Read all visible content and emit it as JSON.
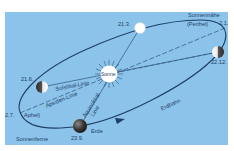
{
  "diagram": {
    "colors": {
      "background": "#8cc3ea",
      "orbit_line": "#1e3f66",
      "sun": "#ffffff",
      "text": "#1e3f66"
    },
    "sun": {
      "label": "Sonne"
    },
    "positions": [
      {
        "date": "21.3.",
        "phase": "white"
      },
      {
        "date": "22.12.",
        "phase": "dark-left"
      },
      {
        "date": "21.6.",
        "phase": "dark-left"
      },
      {
        "date": "23.9.",
        "phase": "dark",
        "name": "Erde"
      }
    ],
    "perihel": {
      "title": "Sonnennähe",
      "subtitle": "(Perihel)",
      "date": "2.1."
    },
    "aphel": {
      "title": "Sonnenferne",
      "subtitle": "Aphel)",
      "date": "2.7."
    },
    "lines": {
      "solstitial": "Solstitial-Linie",
      "apsiden": "Apsiden-Linie",
      "aequinoktial_1": "Äquinoktial-",
      "aequinoktial_2": "Linie"
    },
    "orbit_label": "Erdbahn"
  }
}
